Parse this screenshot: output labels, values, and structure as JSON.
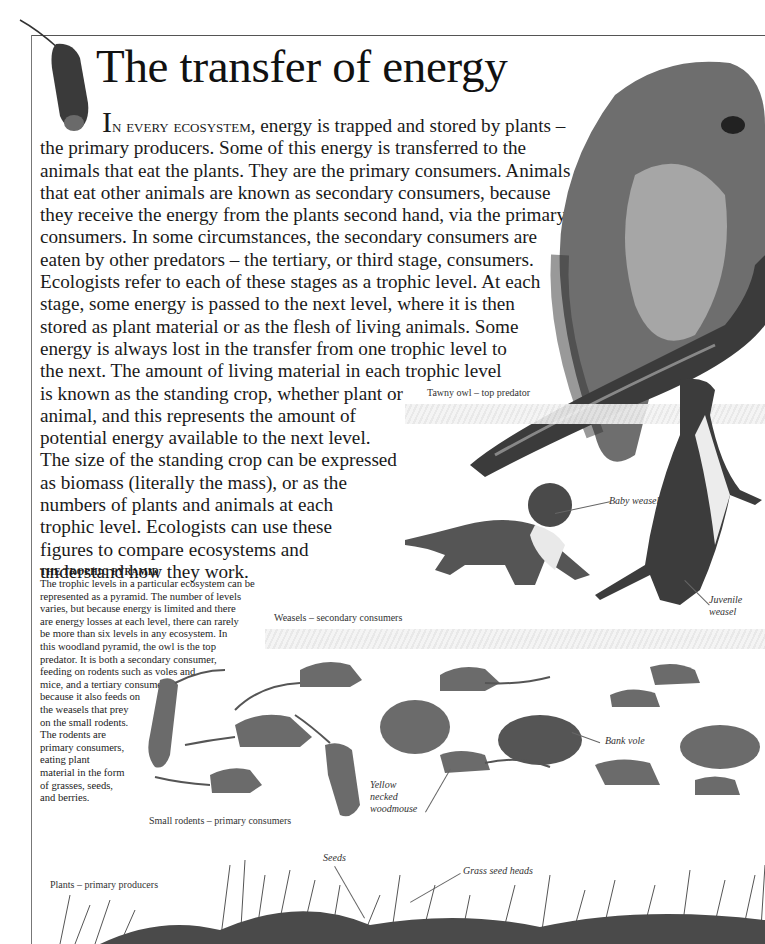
{
  "page": {
    "title": "The transfer of energy",
    "intro": {
      "dropcap": "I",
      "smallcaps_lead": "n every ecosystem,",
      "lines": [
        " energy is trapped and stored by plants –",
        "the primary producers. Some of this energy is transferred to the",
        "animals that eat the plants. They are the primary consumers. Animals",
        "that eat other animals are known as secondary consumers, because",
        "they receive the energy from the plants second hand, via the primary",
        "consumers. In some circumstances, the secondary consumers are",
        "eaten by other predators – the tertiary, or third stage, consumers.",
        "Ecologists refer to each of these stages as a trophic level. At each",
        "stage, some energy is passed to the next level, where it is then",
        "stored as plant material or as the flesh of living animals. Some",
        "energy is always lost in the transfer from one trophic level to",
        "the next. The amount of living material in each trophic level",
        "is known as the standing crop, whether plant or",
        "animal, and this represents the amount of",
        "potential energy available to the next level.",
        "The size of the standing crop can be expressed",
        "as biomass (literally the mass), or as the",
        "numbers of plants and animals at each",
        "trophic level. Ecologists can use these",
        "figures to compare ecosystems and",
        "understand how they work."
      ]
    },
    "sidebar": {
      "heading": "THE TROPHIC PYRAMID",
      "lines": [
        "The trophic levels in a particular ecosystem can be",
        "represented as a pyramid. The number of levels",
        "varies, but because energy is limited and there",
        "are energy losses at each level, there can rarely",
        "be more than six levels in any ecosystem. In",
        "this woodland pyramid, the owl is the top",
        "predator. It is both a secondary consumer,",
        "feeding on rodents such as voles and",
        "mice, and a tertiary consumer,",
        "because it also feeds on",
        "the weasels that prey",
        "on the small rodents.",
        "The rodents are",
        "primary consumers,",
        "eating plant",
        "material in the form",
        "of grasses, seeds,",
        "and berries."
      ]
    },
    "levels": {
      "owl": "Tawny owl – top predator",
      "weasels": "Weasels – secondary consumers",
      "rodents": "Small rodents – primary consumers",
      "plants": "Plants – primary producers"
    },
    "callouts": {
      "baby_weasel": "Baby weasel",
      "juvenile_weasel": [
        "Juvenile",
        "weasel"
      ],
      "bank_vole": "Bank vole",
      "woodmouse": [
        "Yellow",
        "necked",
        "woodmouse"
      ],
      "seeds": "Seeds",
      "grass_seed_heads": "Grass seed heads"
    },
    "colors": {
      "text": "#1a1a1a",
      "rule": "#555555",
      "band": "#e8e8e8"
    }
  }
}
